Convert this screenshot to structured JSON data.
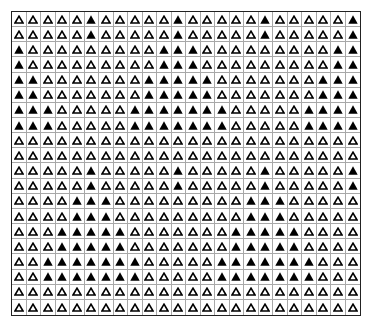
{
  "figure": {
    "rows": 20,
    "cols": 24,
    "legend": {
      "0": "hollow-triangle",
      "1": "filled-triangle"
    },
    "colors": {
      "filled": "#000000",
      "outline": "#000000",
      "grid_line": "#a8a8a8",
      "border": "#222222"
    },
    "pattern": [
      "000001000001000001000001",
      "000001000001000001000001",
      "100000000011100000000011",
      "100000000011100000000011",
      "110000000111110000000111",
      "110000000111110000000111",
      "111000001111111000001111",
      "111000001111111000001111",
      "000000000000000000000000",
      "000000000000000000000000",
      "000001000001000001000001",
      "000001000001000001000001",
      "000011100000000011100000",
      "000011100000000011100000",
      "000111110000000111110000",
      "000111110000000111110000",
      "001111111000001111111000",
      "001111111000001111111000",
      "000000000000000000000000",
      "000000000000000000000000"
    ]
  }
}
